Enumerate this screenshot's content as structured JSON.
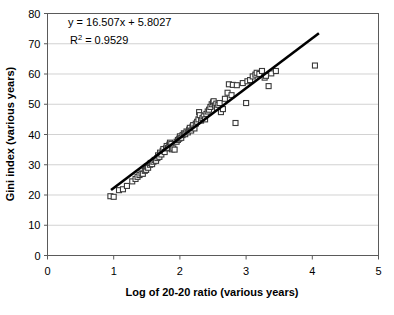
{
  "chart_data": {
    "type": "scatter",
    "title": "",
    "xlabel": "Log of 20-20 ratio (various years)",
    "ylabel": "Gini index (various years)",
    "xlim": [
      0,
      5
    ],
    "ylim": [
      0,
      80
    ],
    "xticks": [
      "0",
      "1",
      "2",
      "3",
      "4",
      "5"
    ],
    "yticks": [
      "0",
      "10",
      "20",
      "30",
      "40",
      "50",
      "60",
      "70",
      "80"
    ],
    "grid": "horizontal",
    "legend": "none",
    "annotations": {
      "equation": "y = 16.507x + 5.8027",
      "r_squared_label": "R",
      "r_squared_exp": "2",
      "r_squared_value": "= 0.9529"
    },
    "trendline": {
      "slope": 16.507,
      "intercept": 5.8027,
      "r_squared": 0.9529,
      "x_start": 0.96,
      "x_end": 4.1,
      "color": "#000000"
    },
    "marker_style": {
      "shape": "open-square",
      "fill": "#ffffff",
      "stroke": "#3a3a3a",
      "size": 5
    },
    "points": [
      [
        0.95,
        19.6
      ],
      [
        1.0,
        19.4
      ],
      [
        1.08,
        21.6
      ],
      [
        1.14,
        21.9
      ],
      [
        1.2,
        23.0
      ],
      [
        1.28,
        24.5
      ],
      [
        1.33,
        25.3
      ],
      [
        1.36,
        26.0
      ],
      [
        1.39,
        26.6
      ],
      [
        1.42,
        27.1
      ],
      [
        1.44,
        27.0
      ],
      [
        1.47,
        28.0
      ],
      [
        1.49,
        28.3
      ],
      [
        1.5,
        29.4
      ],
      [
        1.52,
        29.0
      ],
      [
        1.55,
        30.0
      ],
      [
        1.56,
        30.6
      ],
      [
        1.58,
        30.2
      ],
      [
        1.6,
        31.0
      ],
      [
        1.62,
        31.6
      ],
      [
        1.64,
        31.3
      ],
      [
        1.66,
        32.2
      ],
      [
        1.67,
        33.1
      ],
      [
        1.69,
        32.6
      ],
      [
        1.7,
        34.0
      ],
      [
        1.72,
        33.4
      ],
      [
        1.74,
        34.6
      ],
      [
        1.75,
        35.2
      ],
      [
        1.77,
        34.2
      ],
      [
        1.79,
        35.4
      ],
      [
        1.8,
        36.2
      ],
      [
        1.82,
        35.6
      ],
      [
        1.84,
        36.6
      ],
      [
        1.85,
        37.3
      ],
      [
        1.87,
        36.9
      ],
      [
        1.88,
        35.1
      ],
      [
        1.9,
        35.4
      ],
      [
        1.92,
        35.0
      ],
      [
        1.95,
        37.6
      ],
      [
        1.97,
        38.2
      ],
      [
        1.99,
        38.6
      ],
      [
        2.0,
        39.4
      ],
      [
        2.02,
        38.9
      ],
      [
        2.04,
        39.8
      ],
      [
        2.06,
        40.4
      ],
      [
        2.08,
        40.1
      ],
      [
        2.1,
        41.0
      ],
      [
        2.12,
        40.7
      ],
      [
        2.14,
        41.6
      ],
      [
        2.15,
        42.2
      ],
      [
        2.17,
        41.3
      ],
      [
        2.19,
        42.6
      ],
      [
        2.2,
        43.1
      ],
      [
        2.22,
        42.0
      ],
      [
        2.24,
        43.6
      ],
      [
        2.26,
        44.2
      ],
      [
        2.28,
        45.0
      ],
      [
        2.29,
        47.4
      ],
      [
        2.3,
        46.4
      ],
      [
        2.32,
        44.6
      ],
      [
        2.34,
        45.4
      ],
      [
        2.36,
        46.0
      ],
      [
        2.38,
        45.0
      ],
      [
        2.4,
        46.8
      ],
      [
        2.42,
        47.6
      ],
      [
        2.44,
        48.2
      ],
      [
        2.46,
        49.1
      ],
      [
        2.48,
        50.0
      ],
      [
        2.5,
        50.6
      ],
      [
        2.51,
        51.0
      ],
      [
        2.53,
        49.6
      ],
      [
        2.55,
        50.2
      ],
      [
        2.56,
        48.8
      ],
      [
        2.58,
        49.8
      ],
      [
        2.6,
        50.4
      ],
      [
        2.62,
        47.4
      ],
      [
        2.65,
        48.4
      ],
      [
        2.68,
        51.8
      ],
      [
        2.72,
        53.8
      ],
      [
        2.74,
        56.6
      ],
      [
        2.78,
        53.0
      ],
      [
        2.8,
        56.4
      ],
      [
        2.84,
        43.8
      ],
      [
        2.86,
        56.3
      ],
      [
        2.95,
        57.0
      ],
      [
        3.0,
        50.4
      ],
      [
        3.02,
        57.6
      ],
      [
        3.06,
        58.0
      ],
      [
        3.1,
        59.2
      ],
      [
        3.14,
        59.8
      ],
      [
        3.16,
        60.4
      ],
      [
        3.2,
        60.0
      ],
      [
        3.24,
        61.0
      ],
      [
        3.28,
        58.8
      ],
      [
        3.3,
        59.4
      ],
      [
        3.34,
        56.0
      ],
      [
        3.38,
        60.2
      ],
      [
        3.45,
        61.0
      ],
      [
        4.04,
        62.8
      ]
    ]
  },
  "axis": {
    "x_title": "Log of 20-20 ratio (various years)",
    "y_title": "Gini index (various years)"
  }
}
